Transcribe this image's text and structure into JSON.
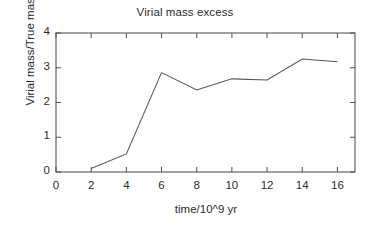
{
  "chart_data": {
    "type": "line",
    "title": "Virial mass excess",
    "xlabel": "time/10^9 yr",
    "ylabel": "Virial mass/True mass",
    "xlim": [
      0,
      17
    ],
    "ylim": [
      0,
      4
    ],
    "xticks": [
      0,
      2,
      4,
      6,
      8,
      10,
      12,
      14,
      16
    ],
    "yticks": [
      0,
      1,
      2,
      3,
      4
    ],
    "xtick_labels": [
      "0",
      "2",
      "4",
      "6",
      "8",
      "10",
      "12",
      "14",
      "16"
    ],
    "ytick_labels": [
      "0",
      "1",
      "2",
      "3",
      "4"
    ],
    "grid": false,
    "legend": false,
    "line_color": "#555555",
    "x": [
      2,
      4,
      6,
      8,
      10,
      12,
      14,
      16
    ],
    "values": [
      0.1,
      0.52,
      2.86,
      2.36,
      2.68,
      2.65,
      3.25,
      3.17
    ],
    "series": [
      {
        "name": "Virial mass excess",
        "x": [
          2,
          4,
          6,
          8,
          10,
          12,
          14,
          16
        ],
        "values": [
          0.1,
          0.52,
          2.86,
          2.36,
          2.68,
          2.65,
          3.25,
          3.17
        ]
      }
    ]
  },
  "figure": {
    "axis_color": "#555555",
    "background": "#ffffff"
  }
}
